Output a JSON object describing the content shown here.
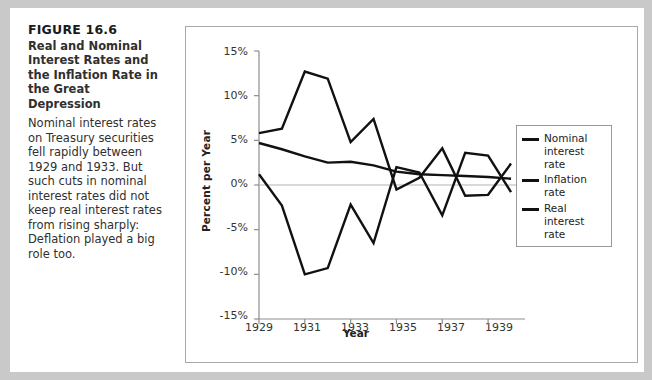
{
  "figure": {
    "label": "FIGURE 16.6",
    "title": "Real and Nominal Interest Rates and the Inflation Rate in the Great Depression",
    "body": "Nominal interest rates on Treasury securities fell rapidly between 1929 and 1933. But such cuts in nominal interest rates did not keep real interest rates from rising sharply: Deflation played a big role too."
  },
  "chart_data": {
    "type": "line",
    "title": "",
    "xlabel": "Year",
    "ylabel": "Percent per Year",
    "xlim": [
      1929,
      1940
    ],
    "ylim": [
      -15,
      15
    ],
    "grid": false,
    "zero_line": true,
    "legend_position": "right",
    "xticks": [
      "1929",
      "1931",
      "1933",
      "1935",
      "1937",
      "1939"
    ],
    "xtick_values": [
      1929,
      1931,
      1933,
      1935,
      1937,
      1939
    ],
    "yticks": [
      "15%",
      "10%",
      "5%",
      "0%",
      "-5%",
      "-10%",
      "-15%"
    ],
    "ytick_values": [
      15,
      10,
      5,
      0,
      -5,
      -10,
      -15
    ],
    "x": [
      1929,
      1930,
      1931,
      1932,
      1933,
      1934,
      1935,
      1936,
      1937,
      1938,
      1939,
      1940
    ],
    "series": [
      {
        "name": "Nominal interest rate",
        "legend_label": "Nominal interest rate",
        "color": "#111111",
        "values": [
          4.7,
          4.0,
          3.2,
          2.5,
          2.6,
          2.2,
          1.5,
          1.2,
          1.1,
          1.0,
          0.9,
          0.7
        ]
      },
      {
        "name": "Inflation rate",
        "legend_label": "Inflation rate",
        "color": "#111111",
        "values": [
          1.2,
          -2.3,
          -10.0,
          -9.3,
          -2.2,
          -6.5,
          2.0,
          1.4,
          -3.4,
          3.6,
          3.3,
          -0.8
        ]
      },
      {
        "name": "Real interest rate",
        "legend_label": "Real interest rate",
        "color": "#111111",
        "values": [
          5.8,
          6.3,
          12.7,
          11.9,
          4.8,
          7.4,
          -0.5,
          0.8,
          4.1,
          -1.2,
          -1.1,
          2.4
        ]
      }
    ]
  }
}
